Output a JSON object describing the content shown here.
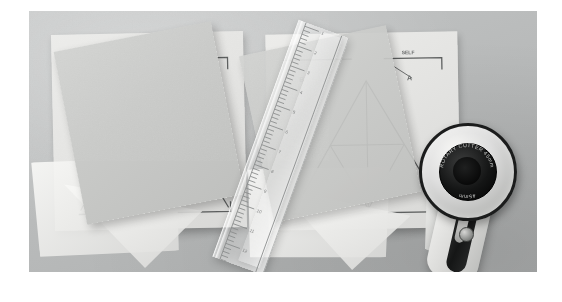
{
  "image": {
    "title": "Quilting workspace with paper templates, acrylic ruler and rotary cutter",
    "kind": "photograph",
    "palette": {
      "page_background": "#ffffff",
      "surface": "#bcbebe",
      "pattern_paper": "#e6e6e4",
      "vellum": "#f2f2f0",
      "card_stock": "#c9cac8",
      "ink": "#5e6060",
      "blade_dark": "#151616",
      "blade_metal": "#c8c9c7"
    },
    "frame": {
      "left": 29,
      "top": 11,
      "width": 508,
      "height": 261
    }
  },
  "left_stack": {
    "name": "left-template-stack",
    "pattern_sheet": {
      "label": "pattern-sheet-left",
      "corner_text": "SELF",
      "piece_labels": [
        "B",
        "A",
        "C"
      ]
    },
    "vellum_overlay": {
      "label": "vellum-overlay-left"
    },
    "cut_card": {
      "label": "card-stock-square-left"
    }
  },
  "right_stack": {
    "name": "right-template-stack",
    "pattern_sheet": {
      "label": "pattern-sheet-right",
      "corner_text": "SELF",
      "piece_labels": [
        "B",
        "A",
        "C"
      ]
    },
    "vellum_overlay": {
      "label": "vellum-overlay-right"
    },
    "cut_card": {
      "label": "card-stock-square-right"
    }
  },
  "ruler": {
    "name": "acrylic-quilting-ruler",
    "tick_labels": [
      "1",
      "2",
      "3",
      "4",
      "5",
      "6",
      "7",
      "8",
      "9",
      "10",
      "11",
      "12"
    ],
    "second_strip": "acrylic-strip"
  },
  "rotary_cutter": {
    "name": "rotary-cutter",
    "hub_text": "ROTARY CUTTER 45mm",
    "blade_diameter_label": "45mm",
    "parts": [
      "blade",
      "hub",
      "blade-guard",
      "handle-grip",
      "thumb-screw"
    ]
  },
  "chart_data": null
}
